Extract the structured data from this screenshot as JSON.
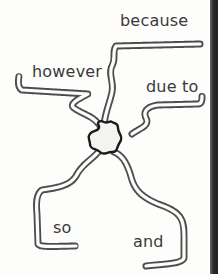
{
  "diagram": {
    "type": "conjunction-road-map",
    "center": {
      "shape": "star",
      "label": ""
    },
    "branches": [
      {
        "id": "because",
        "label": "because"
      },
      {
        "id": "however",
        "label": "however"
      },
      {
        "id": "due-to",
        "label": "due to"
      },
      {
        "id": "so",
        "label": "so"
      },
      {
        "id": "and",
        "label": "and"
      }
    ]
  },
  "colors": {
    "paper": "#fdfdfc",
    "ink": "#3a3a3a",
    "edge": "#1e1e1e"
  }
}
